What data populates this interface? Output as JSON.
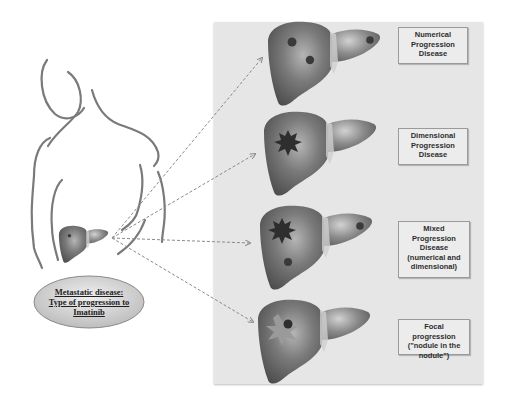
{
  "diagram": {
    "source_label": {
      "lines": [
        "Metastatic disease:",
        "Type of progression to",
        "Imatinib"
      ]
    },
    "progression_types": [
      {
        "id": "numerical",
        "lines": [
          "Numerical",
          "Progression",
          "Disease"
        ],
        "lesions": "multiple small nodules"
      },
      {
        "id": "dimensional",
        "lines": [
          "Dimensional",
          "Progression",
          "Disease"
        ],
        "lesions": "single enlarged spiky nodule"
      },
      {
        "id": "mixed",
        "lines": [
          "Mixed",
          "Progression",
          "Disease",
          "(numerical and",
          "dimensional)"
        ],
        "lesions": "enlarged nodule plus new nodules"
      },
      {
        "id": "focal",
        "lines": [
          "Focal progression",
          "(\"nodule in the",
          "nodule\")"
        ],
        "lesions": "nodule within a nodule"
      }
    ],
    "colors": {
      "panel": "#e6e6e6",
      "liver": "#6e6e6e",
      "arrow": "#8a8a8a",
      "body_outline": "#7a7a7a",
      "ellipse_fill": "#d9d9d9"
    }
  }
}
